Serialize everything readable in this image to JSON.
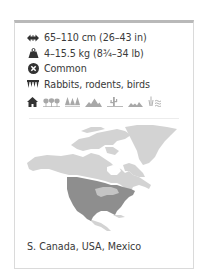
{
  "facts": {
    "length": {
      "icon": "length-arrows-icon",
      "text": "65–110 cm (26–43 in)"
    },
    "weight": {
      "icon": "weight-icon",
      "text": "4–15.5 kg (8¾–34 lb)"
    },
    "status": {
      "icon": "status-cross-circle-icon",
      "text": "Common"
    },
    "diet": {
      "icon": "diet-teeth-icon",
      "text": "Rabbits, rodents, birds"
    }
  },
  "habitats": [
    {
      "icon": "urban-house-icon",
      "active": true
    },
    {
      "icon": "deciduous-forest-icon",
      "active": false
    },
    {
      "icon": "coniferous-forest-icon",
      "active": false
    },
    {
      "icon": "mountains-icon",
      "active": false
    },
    {
      "icon": "desert-cactus-icon",
      "active": false
    },
    {
      "icon": "grassland-icon",
      "active": false
    },
    {
      "icon": "wetland-icon",
      "active": false
    }
  ],
  "map": {
    "icon": "north-america-range-map",
    "land_color": "#d0d0d0",
    "range_color": "#8c8c8c"
  },
  "region": "S. Canada, USA, Mexico",
  "colors": {
    "text": "#3a3a3a",
    "icon_dark": "#333333",
    "icon_light": "#a8a8a8",
    "card_border": "#dadada",
    "card_top_bar": "#b9b9b9"
  }
}
